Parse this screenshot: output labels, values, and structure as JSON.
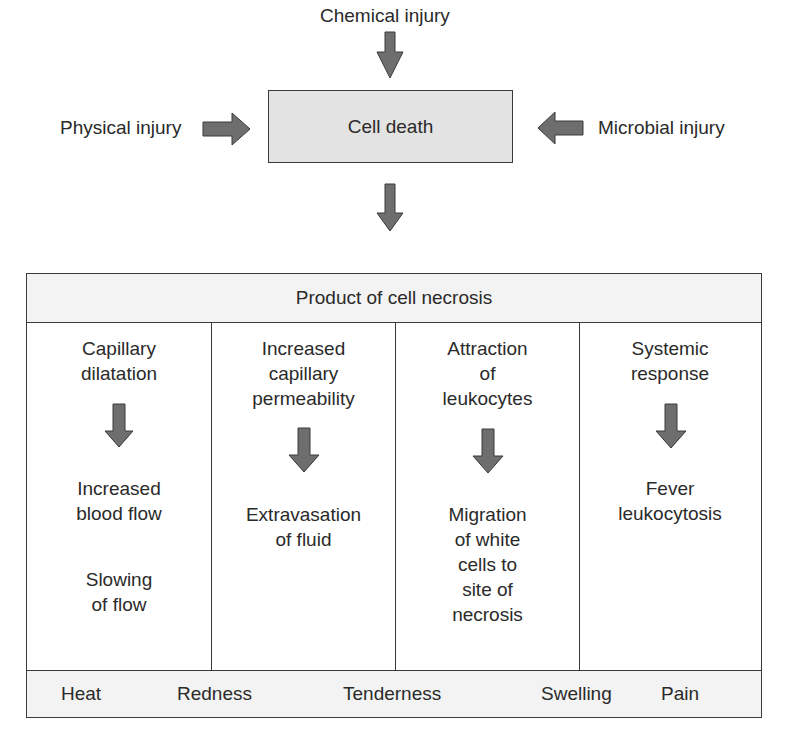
{
  "injuries": {
    "top": "Chemical injury",
    "left": "Physical injury",
    "right": "Microbial injury"
  },
  "center_box": "Cell death",
  "table": {
    "header": "Product of cell necrosis",
    "columns": [
      {
        "cause": "Capillary\ndilatation",
        "effects": [
          "Increased\nblood flow",
          "Slowing\nof flow"
        ]
      },
      {
        "cause": "Increased\ncapillary\npermeability",
        "effects": [
          "Extravasation\nof fluid"
        ]
      },
      {
        "cause": "Attraction\nof\nleukocytes",
        "effects": [
          "Migration\nof white\ncells to\nsite of\nnecrosis"
        ]
      },
      {
        "cause": "Systemic\nresponse",
        "effects": [
          "Fever\nleukocytosis"
        ]
      }
    ],
    "footer_signs": [
      "Heat",
      "Redness",
      "Tenderness",
      "Swelling",
      "Pain"
    ]
  },
  "colors": {
    "arrow_fill": "#6e6e6e",
    "box_fill": "#e3e3e3",
    "band_fill": "#f3f3f3",
    "line": "#3a3a3a"
  }
}
